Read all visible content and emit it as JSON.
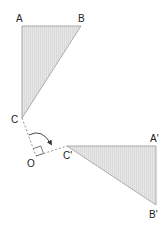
{
  "diagram": {
    "type": "rotation-geometry",
    "labels": {
      "A": "A",
      "B": "B",
      "C": "C",
      "O": "O",
      "C_prime": "C'",
      "A_prime": "A'",
      "B_prime": "B'"
    },
    "points": {
      "A": [
        22,
        26
      ],
      "B": [
        81,
        26
      ],
      "C": [
        22,
        118
      ],
      "O": [
        36,
        156
      ],
      "C_prime": [
        67,
        146
      ],
      "A_prime": [
        156,
        146
      ],
      "B_prime": [
        156,
        205
      ]
    },
    "colors": {
      "fill": "#e2e2e2",
      "stroke": "#9a9a9a",
      "dash": "#777777",
      "text": "#222222"
    },
    "right_angle_marker": true,
    "rotation_arrow": true
  }
}
